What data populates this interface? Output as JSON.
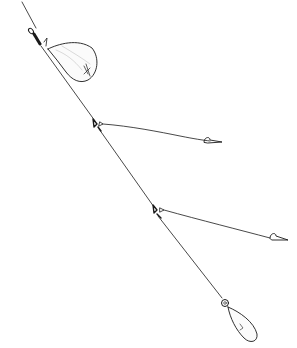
{
  "illustration": {
    "subject": "fishing rig line drawing",
    "background": "#ffffff",
    "ink": "#1a1a1a",
    "components": [
      {
        "name": "main-line",
        "from": [
          22,
          0
        ],
        "to": [
          222,
          318
        ]
      },
      {
        "name": "swivel",
        "at": [
          36,
          37
        ]
      },
      {
        "name": "feeder-bag",
        "center": [
          72,
          62
        ]
      },
      {
        "name": "upper-dropper",
        "knot": [
          96,
          124
        ],
        "hook": [
          212,
          142
        ]
      },
      {
        "name": "lower-dropper",
        "knot": [
          156,
          211
        ],
        "hook": [
          284,
          240
        ]
      },
      {
        "name": "sinker",
        "eye": [
          225,
          303
        ],
        "tip": [
          256,
          341
        ]
      }
    ]
  }
}
